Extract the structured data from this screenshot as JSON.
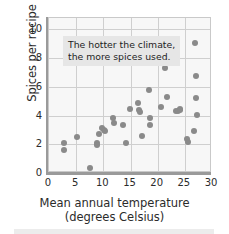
{
  "chart_data": {
    "type": "scatter",
    "title": "",
    "xlabel": "Mean annual temperature",
    "xlabel_line2": "(degrees Celsius)",
    "ylabel": "Spices per recipe",
    "xlim": [
      0,
      30
    ],
    "ylim": [
      0,
      10.8
    ],
    "xticks": [
      0,
      5,
      10,
      15,
      20,
      25,
      30
    ],
    "yticks": [
      0,
      2,
      4,
      6,
      8,
      10
    ],
    "grid": true,
    "legend": "none",
    "annotations": [
      {
        "text_line1": "The hotter the climate,",
        "text_line2": "the more spices used.",
        "x": 5.0,
        "y": 9.3
      }
    ],
    "marker_color": "#8a8a8a",
    "plot_background": "#f7f7f7",
    "grid_color": "#cfcfcf",
    "axis_color": "#9a9a9a",
    "points": [
      {
        "x": 2.7,
        "y": 2.1
      },
      {
        "x": 2.7,
        "y": 1.6
      },
      {
        "x": 5.2,
        "y": 2.5
      },
      {
        "x": 7.6,
        "y": 0.35
      },
      {
        "x": 8.8,
        "y": 2.1
      },
      {
        "x": 8.8,
        "y": 1.95
      },
      {
        "x": 9.2,
        "y": 2.7
      },
      {
        "x": 9.8,
        "y": 3.15
      },
      {
        "x": 10.2,
        "y": 3.0
      },
      {
        "x": 10.3,
        "y": 2.95
      },
      {
        "x": 11.8,
        "y": 3.8
      },
      {
        "x": 11.9,
        "y": 3.5
      },
      {
        "x": 13.6,
        "y": 3.35
      },
      {
        "x": 14.2,
        "y": 2.1
      },
      {
        "x": 14.9,
        "y": 4.45
      },
      {
        "x": 16.4,
        "y": 4.9
      },
      {
        "x": 16.6,
        "y": 4.4
      },
      {
        "x": 16.7,
        "y": 4.25
      },
      {
        "x": 17.1,
        "y": 2.6
      },
      {
        "x": 18.4,
        "y": 5.75
      },
      {
        "x": 18.6,
        "y": 3.85
      },
      {
        "x": 18.5,
        "y": 3.35
      },
      {
        "x": 20.6,
        "y": 4.6
      },
      {
        "x": 21.4,
        "y": 7.35
      },
      {
        "x": 21.8,
        "y": 5.3
      },
      {
        "x": 23.3,
        "y": 4.3
      },
      {
        "x": 23.8,
        "y": 4.3
      },
      {
        "x": 24.1,
        "y": 4.45
      },
      {
        "x": 24.2,
        "y": 4.4
      },
      {
        "x": 25.4,
        "y": 2.35
      },
      {
        "x": 25.5,
        "y": 2.15
      },
      {
        "x": 26.8,
        "y": 9.05
      },
      {
        "x": 27.1,
        "y": 6.75
      },
      {
        "x": 27.0,
        "y": 5.25
      },
      {
        "x": 27.3,
        "y": 4.05
      },
      {
        "x": 26.6,
        "y": 2.95
      }
    ]
  }
}
